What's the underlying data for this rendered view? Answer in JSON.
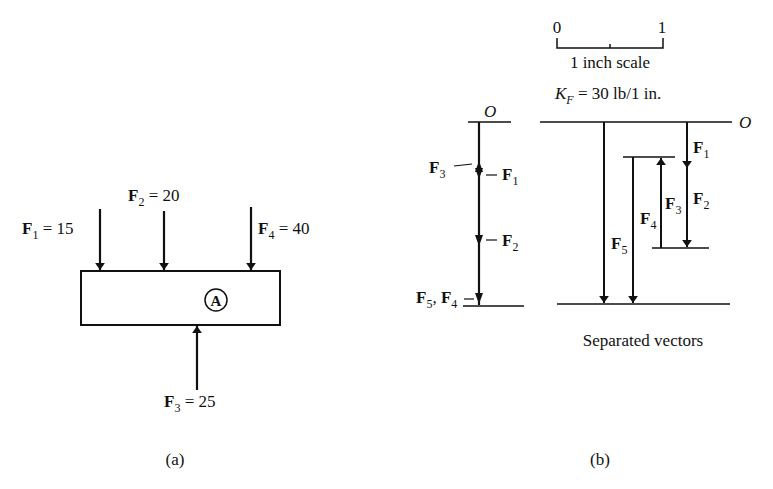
{
  "panel_a": {
    "caption": "(a)",
    "body_label": "A",
    "forces": [
      {
        "name": "F",
        "sub": "1",
        "value": "15",
        "direction": "down"
      },
      {
        "name": "F",
        "sub": "2",
        "value": "20",
        "direction": "down"
      },
      {
        "name": "F",
        "sub": "3",
        "value": "25",
        "direction": "up"
      },
      {
        "name": "F",
        "sub": "4",
        "value": "40",
        "direction": "down"
      }
    ],
    "eq": " = "
  },
  "panel_b": {
    "caption": "(b)",
    "scale": {
      "start": "0",
      "end": "1",
      "label": "1 inch scale",
      "kf_symbol": "K",
      "kf_sub": "F",
      "kf_value": " = 30 lb/1 in."
    },
    "combined": {
      "origin": "O",
      "labels": {
        "f3": {
          "name": "F",
          "sub": "3"
        },
        "f1": {
          "name": "F",
          "sub": "1"
        },
        "f2": {
          "name": "F",
          "sub": "2"
        },
        "f5f4": {
          "name1": "F",
          "sub1": "5",
          "sep": ", ",
          "name2": "F",
          "sub2": "4"
        }
      }
    },
    "separated": {
      "origin": "O",
      "caption": "Separated vectors",
      "labels": {
        "f1": {
          "name": "F",
          "sub": "1"
        },
        "f2": {
          "name": "F",
          "sub": "2"
        },
        "f3": {
          "name": "F",
          "sub": "3"
        },
        "f4": {
          "name": "F",
          "sub": "4"
        },
        "f5": {
          "name": "F",
          "sub": "5"
        }
      }
    }
  }
}
